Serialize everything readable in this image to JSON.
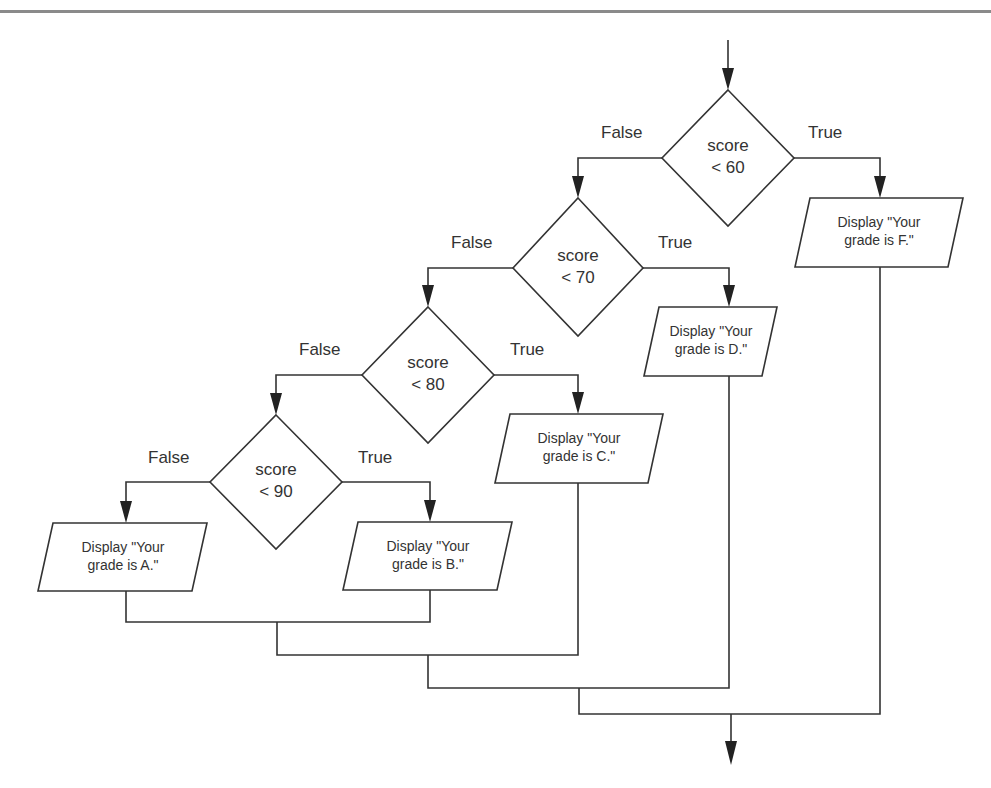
{
  "diagram": {
    "type": "flowchart",
    "title": "",
    "entry_arrow": true,
    "exit_arrow": true,
    "decisions": [
      {
        "id": "d60",
        "line1": "score",
        "line2": "< 60",
        "false_label": "False",
        "true_label": "True"
      },
      {
        "id": "d70",
        "line1": "score",
        "line2": "< 70",
        "false_label": "False",
        "true_label": "True"
      },
      {
        "id": "d80",
        "line1": "score",
        "line2": "< 80",
        "false_label": "False",
        "true_label": "True"
      },
      {
        "id": "d90",
        "line1": "score",
        "line2": "< 90",
        "false_label": "False",
        "true_label": "True"
      }
    ],
    "outputs": [
      {
        "id": "outF",
        "line1": "Display \"Your",
        "line2": "grade is F.\""
      },
      {
        "id": "outD",
        "line1": "Display \"Your",
        "line2": "grade is D.\""
      },
      {
        "id": "outC",
        "line1": "Display \"Your",
        "line2": "grade is C.\""
      },
      {
        "id": "outB",
        "line1": "Display \"Your",
        "line2": "grade is B.\""
      },
      {
        "id": "outA",
        "line1": "Display \"Your",
        "line2": "grade is A.\""
      }
    ],
    "edges": [
      {
        "from": "start",
        "to": "d60"
      },
      {
        "from": "d60",
        "to": "outF",
        "label": "True"
      },
      {
        "from": "d60",
        "to": "d70",
        "label": "False"
      },
      {
        "from": "d70",
        "to": "outD",
        "label": "True"
      },
      {
        "from": "d70",
        "to": "d80",
        "label": "False"
      },
      {
        "from": "d80",
        "to": "outC",
        "label": "True"
      },
      {
        "from": "d80",
        "to": "d90",
        "label": "False"
      },
      {
        "from": "d90",
        "to": "outB",
        "label": "True"
      },
      {
        "from": "d90",
        "to": "outA",
        "label": "False"
      },
      {
        "from": [
          "outA",
          "outB",
          "outC",
          "outD",
          "outF"
        ],
        "to": "end"
      }
    ],
    "colors": {
      "stroke": "#333333",
      "text": "#333333",
      "rule": "#8a8a8a",
      "background": "#ffffff"
    }
  }
}
